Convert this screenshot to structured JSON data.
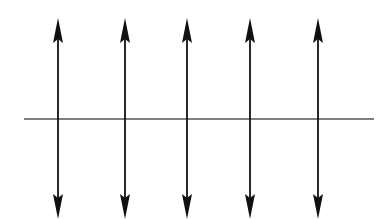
{
  "diagram": {
    "background": "#ffffff",
    "stroke_color": "#111111",
    "baseline": {
      "x1": 24,
      "x2": 374,
      "y": 119,
      "color": "#555555",
      "width": 1.4
    },
    "arrows": [
      {
        "x": 58,
        "y_top": 18,
        "y_bottom": 219
      },
      {
        "x": 125,
        "y_top": 18,
        "y_bottom": 219
      },
      {
        "x": 187,
        "y_top": 18,
        "y_bottom": 219
      },
      {
        "x": 250,
        "y_top": 18,
        "y_bottom": 219
      },
      {
        "x": 318,
        "y_top": 18,
        "y_bottom": 219
      }
    ],
    "arrowhead": {
      "length": 25,
      "half_width": 5
    }
  }
}
